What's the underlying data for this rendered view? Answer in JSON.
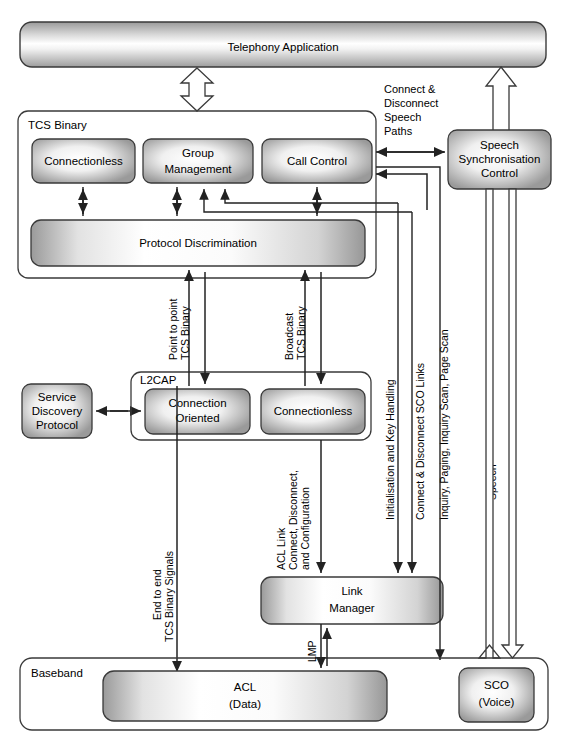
{
  "diagram": {
    "colors": {
      "box_fill_edge": "#8f8f8f",
      "box_fill_center": "#ffffff",
      "stroke": "#3a3a3a",
      "background": "#ffffff"
    },
    "top": {
      "telephony_application": "Telephony Application"
    },
    "tcs": {
      "container_label": "TCS Binary",
      "blocks": [
        {
          "id": "connectionless",
          "label": "Connectionless"
        },
        {
          "id": "group-management",
          "label_line1": "Group",
          "label_line2": "Management"
        },
        {
          "id": "call-control",
          "label": "Call Control"
        },
        {
          "id": "protocol-discrimination",
          "label": "Protocol Discrimination"
        }
      ]
    },
    "speech_sync": {
      "line1": "Speech",
      "line2": "Synchronisation",
      "line3": "Control"
    },
    "sdp": {
      "line1": "Service",
      "line2": "Discovery",
      "line3": "Protocol"
    },
    "l2cap": {
      "container_label": "L2CAP",
      "blocks": [
        {
          "id": "connection-oriented",
          "label_line1": "Connection",
          "label_line2": "Oriented"
        },
        {
          "id": "connectionless",
          "label": "Connectionless"
        }
      ]
    },
    "link_manager": {
      "line1": "Link",
      "line2": "Manager"
    },
    "baseband": {
      "container_label": "Baseband",
      "blocks": [
        {
          "id": "acl",
          "label_line1": "ACL",
          "label_line2": "(Data)"
        },
        {
          "id": "sco",
          "label_line1": "SCO",
          "label_line2": "(Voice)"
        }
      ]
    },
    "edge_labels": {
      "connect_disconnect_speech_paths": {
        "l1": "Connect &",
        "l2": "Disconnect",
        "l3": "Speech",
        "l4": "Paths"
      },
      "point_to_point_tcs_binary": {
        "l1": "Point to point",
        "l2": "TCS Binary"
      },
      "broadcast_tcs_binary": {
        "l1": "Broadcast",
        "l2": "TCS Binary"
      },
      "initialisation_and_key_handling": "Initialisation and Key Handling",
      "connect_disconnect_sco_links": "Connect & Disconnect SCO Links",
      "inquiry_paging_scan": "Inquiry, Paging, Inquiry Scan, Page Scan",
      "speech": "Speech",
      "end_to_end_tcs_binary_signals": {
        "l1": "End to end",
        "l2": "TCS Binary Signals"
      },
      "acl_link_connect": {
        "l1": "ACL Link",
        "l2": "Connect, Disconnect,",
        "l3": "and Configuration"
      },
      "lmp": "LMP"
    }
  }
}
